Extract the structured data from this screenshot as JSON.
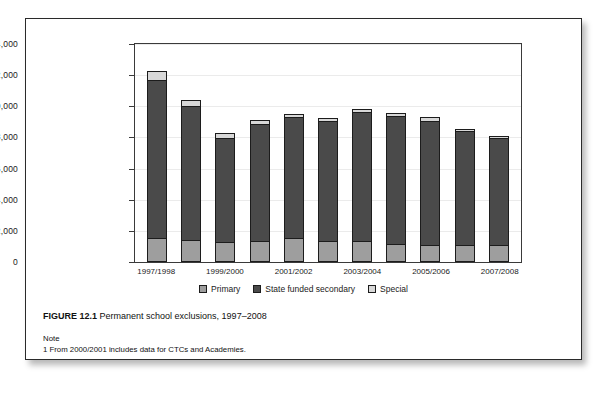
{
  "figure": {
    "label": "FIGURE 12.1",
    "caption": "Permanent school exclusions, 1997–2008"
  },
  "note": {
    "heading": "Note",
    "line": "1  From 2000/2001 includes data for CTCs and Academies."
  },
  "legend": {
    "position": "bottom",
    "items": [
      {
        "label": "Primary",
        "color": "#9e9e9e"
      },
      {
        "label": "State funded secondary",
        "color": "#4a4a4a"
      },
      {
        "label": "Special",
        "color": "#d8d8d8"
      }
    ]
  },
  "chart_data": {
    "type": "bar",
    "stacked": true,
    "title": "Permanent school exclusions, 1997–2008",
    "xlabel": "",
    "ylabel": "",
    "ylim": [
      0,
      14000
    ],
    "yticks": [
      0,
      2000,
      4000,
      6000,
      8000,
      10000,
      12000,
      14000
    ],
    "ytick_labels": [
      "0",
      "2,000",
      "4,000",
      "6,000",
      "8,000",
      "10,000",
      "12,000",
      "14,000"
    ],
    "grid": true,
    "legend_position": "bottom",
    "categories": [
      "1997/1998",
      "1998/1999",
      "1999/2000",
      "2000/2001",
      "2001/2002",
      "2002/2003",
      "2003/2004",
      "2004/2005",
      "2005/2006",
      "2006/2007",
      "2007/2008"
    ],
    "visible_tick_labels": [
      "1997/1998",
      "",
      "1999/2000",
      "",
      "2001/2002",
      "",
      "2003/2004",
      "",
      "2005/2006",
      "",
      "2007/2008"
    ],
    "series": [
      {
        "name": "Primary",
        "color": "#9e9e9e",
        "values": [
          1540,
          1440,
          1290,
          1370,
          1570,
          1330,
          1370,
          1130,
          1080,
          1070,
          1070
        ]
      },
      {
        "name": "State funded secondary",
        "color": "#4a4a4a",
        "values": [
          10130,
          8560,
          6670,
          7480,
          7760,
          7720,
          8260,
          8250,
          8000,
          7320,
          6900
        ]
      },
      {
        "name": "Special",
        "color": "#d8d8d8",
        "values": [
          630,
          400,
          340,
          300,
          170,
          200,
          220,
          220,
          220,
          160,
          130
        ]
      }
    ],
    "totals": [
      12300,
      10400,
      8300,
      9150,
      9500,
      9250,
      9850,
      9600,
      9300,
      8550,
      8100
    ]
  }
}
